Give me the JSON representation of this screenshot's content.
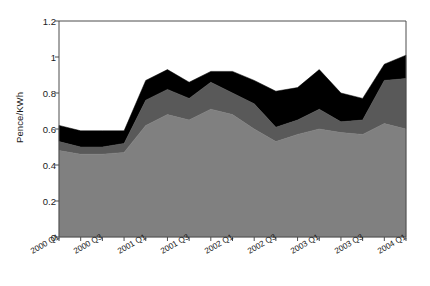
{
  "chart_data": {
    "type": "area",
    "stacked": true,
    "title": "",
    "xlabel": "",
    "ylabel": "Pence/KWh",
    "ylim": [
      0,
      1.2
    ],
    "yticks": [
      "0",
      "0.2",
      "0.4",
      "0.6",
      "0.8",
      "1",
      "1.2"
    ],
    "ytick_values": [
      0,
      0.2,
      0.4,
      0.6,
      0.8,
      1,
      1.2
    ],
    "grid": false,
    "legend": "none",
    "x": [
      "2000 Q1",
      "2000 Q2",
      "2000 Q3",
      "2000 Q4",
      "2001 Q1",
      "2001 Q2",
      "2001 Q3",
      "2001 Q4",
      "2002 Q1",
      "2002 Q2",
      "2002 Q3",
      "2002 Q4",
      "2003 Q1",
      "2003 Q2",
      "2003 Q3",
      "2003 Q4",
      "2004 Q1"
    ],
    "xtick_labels": [
      "2000 Q1",
      "2000 Q3",
      "2001 Q1",
      "2001 Q3",
      "2002 Q1",
      "2002 Q3",
      "2003 Q1",
      "2003 Q3",
      "2004 Q1"
    ],
    "xtick_label_indices": [
      0,
      2,
      4,
      6,
      8,
      10,
      12,
      14,
      16
    ],
    "series": [
      {
        "name": "series-1",
        "color": "#808080",
        "values": [
          0.48,
          0.46,
          0.46,
          0.47,
          0.62,
          0.68,
          0.65,
          0.71,
          0.68,
          0.6,
          0.53,
          0.57,
          0.6,
          0.58,
          0.57,
          0.63,
          0.6
        ]
      },
      {
        "name": "series-2",
        "color": "#595959",
        "values": [
          0.05,
          0.04,
          0.04,
          0.05,
          0.14,
          0.14,
          0.12,
          0.15,
          0.12,
          0.14,
          0.08,
          0.08,
          0.11,
          0.06,
          0.08,
          0.24,
          0.28
        ]
      },
      {
        "name": "series-3",
        "color": "#000000",
        "values": [
          0.09,
          0.09,
          0.09,
          0.07,
          0.11,
          0.11,
          0.09,
          0.06,
          0.12,
          0.13,
          0.2,
          0.18,
          0.22,
          0.16,
          0.12,
          0.09,
          0.13
        ]
      }
    ],
    "totals": [
      0.62,
      0.59,
      0.59,
      0.59,
      0.87,
      0.93,
      0.86,
      0.92,
      0.92,
      0.87,
      0.81,
      0.83,
      0.93,
      0.8,
      0.77,
      0.96,
      1.01
    ]
  },
  "axes": {
    "plot_left": 59,
    "plot_right": 406,
    "plot_top": 21,
    "plot_bottom": 237,
    "frame_color": "#4d4d4d",
    "tick_color": "#4d4d4d"
  }
}
